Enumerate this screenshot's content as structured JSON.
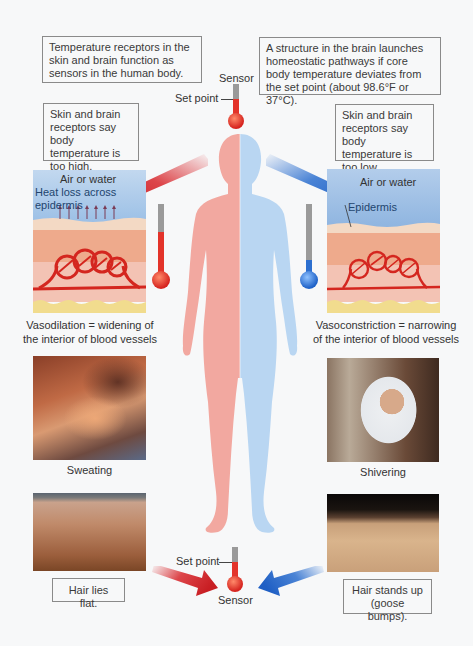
{
  "top": {
    "sensors_box": "Temperature receptors in the skin and brain function as sensors in the human body.",
    "brain_box": "A structure in the brain launches homeostatic pathways if core body temperature deviates from the set point (about 98.6°F or 37°C).",
    "sensor_label": "Sensor",
    "set_point_label": "Set point"
  },
  "left": {
    "condition_box": "Skin and brain receptors say body temperature is too high.",
    "skin_diagram": {
      "air_label": "Air or water",
      "heat_loss_label": "Heat loss across epidermis"
    },
    "mechanism_caption": "Vasodilation = widening of the interior of blood vessels",
    "photo1_caption": "Sweating",
    "hair_box": "Hair lies flat.",
    "color": "#d8262b"
  },
  "right": {
    "condition_box": "Skin and brain receptors say body temperature is too low.",
    "skin_diagram": {
      "air_label": "Air or water",
      "epidermis_label": "Epidermis"
    },
    "mechanism_caption": "Vasoconstriction = narrowing of the interior of blood vessels",
    "photo1_caption": "Shivering",
    "hair_box": "Hair stands up (goose bumps).",
    "color": "#2c6fcf"
  },
  "bottom": {
    "set_point_label": "Set point",
    "sensor_label": "Sensor"
  },
  "colors": {
    "background": "#f7f8f9",
    "body_warm": "#f2a8a0",
    "body_cool": "#b9d6f2",
    "hot": "#d8262b",
    "cold": "#2c6fcf"
  }
}
